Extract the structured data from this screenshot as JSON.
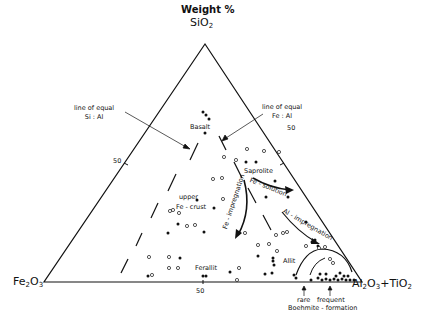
{
  "title": "Weight %",
  "vertices": {
    "top": {
      "label": "SiO",
      "sub": "2"
    },
    "left": {
      "label": "Fe",
      "sub1": "2",
      "mid": "O",
      "sub2": "3"
    },
    "right": {
      "label": "Al",
      "sub1": "2",
      "mid": "O",
      "sub2": "3",
      "tail": "+TiO",
      "sub3": "2"
    }
  },
  "ticks": {
    "left": "50",
    "right": "50",
    "bottom": "50"
  },
  "annotations": {
    "equal_si_al": [
      "line of equal",
      "Si : Al"
    ],
    "equal_fe_al": [
      "line of equal",
      "Fe : Al"
    ],
    "basalt": "Basalt",
    "saprolite": "Saprolite",
    "fe_solution": "Fe - solution",
    "upper": "upper",
    "fe_crust": "Fe - crust",
    "fe_impregnation": "Fe - impregnation",
    "al_impregnation": "Al - impregnation",
    "ferallit": "Ferallit",
    "allit": "Allit",
    "rare": "rare",
    "frequent": "frequent",
    "boehmite": "Boehmite - formation"
  },
  "colors": {
    "ink": "#111111",
    "background": "#ffffff"
  }
}
